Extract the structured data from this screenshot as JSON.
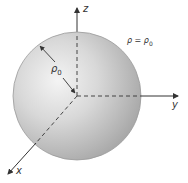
{
  "diagram": {
    "type": "sphere-spherical-coordinates",
    "axes": {
      "z": {
        "label": "z"
      },
      "y": {
        "label": "y"
      },
      "x": {
        "label": "x"
      }
    },
    "radius_label": "ρ0",
    "radius_label_base": "ρ",
    "radius_label_sub": "0",
    "equation_label": "ρ = ρ0",
    "equation_lhs": "ρ = ρ",
    "equation_sub": "0",
    "colors": {
      "sphere_light": "#eeeeee",
      "sphere_mid": "#cfcfcf",
      "sphere_dark": "#a8a8a8",
      "sphere_edge": "#9a9a9a",
      "axis": "#333333"
    }
  }
}
